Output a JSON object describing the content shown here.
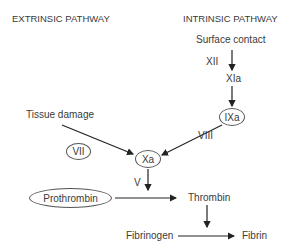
{
  "headers": {
    "extrinsic": "EXTRINSIC PATHWAY",
    "intrinsic": "INTRINSIC PATHWAY"
  },
  "nodes": {
    "surface_contact": "Surface contact",
    "xii": "XII",
    "xia": "XIa",
    "ixa": "IXa",
    "tissue_damage": "Tissue damage",
    "vii": "VII",
    "viii": "VIII",
    "xa": "Xa",
    "v": "V",
    "prothrombin": "Prothrombin",
    "thrombin": "Thrombin",
    "fibrinogen": "Fibrinogen",
    "fibrin": "Fibrin"
  },
  "edges": [
    {
      "from": "Surface contact",
      "to": "XIa",
      "label": "XII"
    },
    {
      "from": "XIa",
      "to": "IXa"
    },
    {
      "from": "IXa",
      "to": "Xa",
      "label": "VIII"
    },
    {
      "from": "Tissue damage",
      "to": "Xa",
      "label": "VII"
    },
    {
      "from": "Xa",
      "to": "Prothrombin→Thrombin",
      "label": "V"
    },
    {
      "from": "Prothrombin",
      "to": "Thrombin"
    },
    {
      "from": "Thrombin",
      "to": "Fibrinogen→Fibrin"
    },
    {
      "from": "Fibrinogen",
      "to": "Fibrin"
    }
  ],
  "colors": {
    "line": "#222222",
    "text": "#3a3a3a",
    "background": "#ffffff"
  }
}
